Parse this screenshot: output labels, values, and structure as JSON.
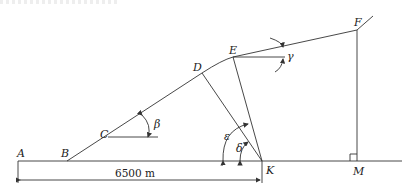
{
  "diagram": {
    "type": "terrain-geometry",
    "points": {
      "A": {
        "label": "A"
      },
      "B": {
        "label": "B"
      },
      "C": {
        "label": "C"
      },
      "D": {
        "label": "D"
      },
      "E": {
        "label": "E"
      },
      "F": {
        "label": "F"
      },
      "K": {
        "label": "K"
      },
      "M": {
        "label": "M"
      }
    },
    "angles": {
      "beta": "β",
      "gamma": "γ",
      "delta": "δ",
      "epsilon": "ε"
    },
    "dimension": {
      "label": "6500 m",
      "from": "A",
      "to": "K"
    },
    "colors": {
      "line": "#333333",
      "text": "#222222",
      "background": "#ffffff"
    }
  }
}
